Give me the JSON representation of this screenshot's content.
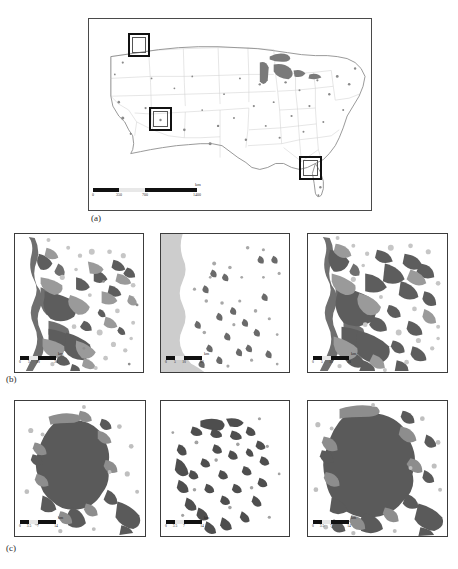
{
  "figure": {
    "panels": [
      {
        "id": "a",
        "caption": "(a)",
        "kind": "overview-map",
        "region": "Conterminous United States",
        "study_area_boxes": [
          {
            "name": "box-pacific-northwest",
            "x_pct": 14.5,
            "y_pct": 8.0,
            "w_pct": 6.0,
            "h_pct": 10.0
          },
          {
            "name": "box-southwest",
            "x_pct": 21.5,
            "y_pct": 46.0,
            "w_pct": 6.5,
            "h_pct": 10.5
          },
          {
            "name": "box-southeast",
            "x_pct": 74.5,
            "y_pct": 71.0,
            "w_pct": 6.5,
            "h_pct": 10.5
          }
        ],
        "scalebar": {
          "name": "scalebar-national",
          "unit": "km",
          "ticks": [
            "0",
            "350",
            "700",
            "1400"
          ],
          "total_px": 104
        }
      },
      {
        "id": "b",
        "caption": "(b)",
        "kind": "study-area-row",
        "tiles": [
          {
            "name": "tile-b-left",
            "scalebar": {
              "unit": "km",
              "ticks": [
                "0",
                "5",
                "10",
                "20"
              ]
            }
          },
          {
            "name": "tile-b-middle",
            "scalebar": {
              "unit": "km",
              "ticks": [
                "0",
                "5",
                "10",
                "20"
              ]
            }
          },
          {
            "name": "tile-b-right",
            "scalebar": {
              "unit": "km",
              "ticks": [
                "0",
                "5",
                "10",
                "20"
              ]
            }
          }
        ]
      },
      {
        "id": "c",
        "caption": "(c)",
        "kind": "study-area-row",
        "tiles": [
          {
            "name": "tile-c-left",
            "scalebar": {
              "unit": "km",
              "ticks": [
                "0",
                "3.5",
                "7",
                "14"
              ]
            }
          },
          {
            "name": "tile-c-middle",
            "scalebar": {
              "unit": "km",
              "ticks": [
                "0",
                "3.5",
                "7",
                "14"
              ]
            }
          },
          {
            "name": "tile-c-right",
            "scalebar": {
              "unit": "km",
              "ticks": [
                "0",
                "3.5",
                "7",
                "14"
              ]
            }
          }
        ]
      }
    ]
  },
  "colors": {
    "frame": "#3c3c3c",
    "panel_a_frame": "#4a4a4a",
    "land": "#ffffff",
    "state_border": "#c9c9c9",
    "coastline": "#8e8e8e",
    "water_light": "#cfcfcf",
    "urban_dark": "#595959",
    "urban_mid": "#909090",
    "urban_light": "#c2c2c2",
    "scalebar_bar": "#111111",
    "text": "#222222"
  }
}
